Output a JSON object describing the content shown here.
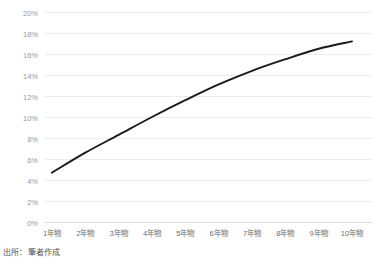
{
  "figure": {
    "source_note": "出所：筆者作成",
    "background_color": "#ffffff",
    "grid_color": "#ececec",
    "axis_color": "#dcdcdc",
    "tick_label_color": "#9a9a9a"
  },
  "chart_data": {
    "type": "line",
    "title": "",
    "subtitle": "",
    "xlabel": "",
    "ylabel": "",
    "categories": [
      "1年物",
      "2年物",
      "3年物",
      "4年物",
      "5年物",
      "6年物",
      "7年物",
      "8年物",
      "9年物",
      "10年物"
    ],
    "series": [
      {
        "name": "",
        "color": "#1a1a1a",
        "values": [
          4.7,
          6.6,
          8.3,
          10.0,
          11.6,
          13.1,
          14.4,
          15.5,
          16.5,
          17.2
        ]
      }
    ],
    "ylim": [
      0,
      20
    ],
    "ytick_values": [
      0,
      2,
      4,
      6,
      8,
      10,
      12,
      14,
      16,
      18,
      20
    ],
    "ytick_labels": [
      "0%",
      "2%",
      "4%",
      "6%",
      "8%",
      "10%",
      "12%",
      "14%",
      "16%",
      "18%",
      "20%"
    ],
    "grid": "horizontal",
    "legend": "none",
    "annotations": []
  }
}
